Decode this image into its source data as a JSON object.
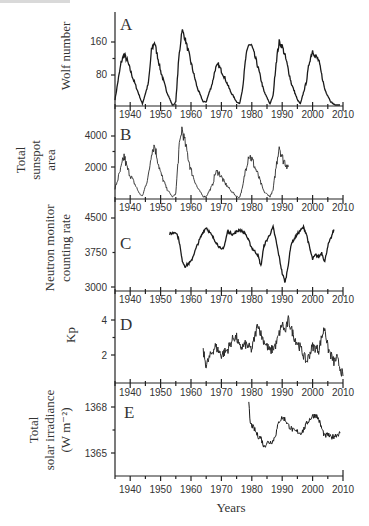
{
  "chart_data": [
    {
      "panel": "A",
      "type": "line",
      "ylabel": "Wolf number",
      "yticks": [
        80,
        160
      ],
      "ylim": [
        0,
        200
      ],
      "xlim": [
        1935,
        2010
      ],
      "x": [
        1935,
        1937,
        1938,
        1939,
        1941,
        1943,
        1944,
        1946,
        1947,
        1948,
        1950,
        1952,
        1954,
        1955,
        1956,
        1957,
        1958,
        1960,
        1962,
        1964,
        1965,
        1967,
        1968,
        1969,
        1971,
        1973,
        1975,
        1976,
        1977,
        1978,
        1979,
        1980,
        1982,
        1984,
        1986,
        1987,
        1988,
        1989,
        1990,
        1991,
        1993,
        1995,
        1996,
        1998,
        1999,
        2000,
        2001,
        2002,
        2004,
        2006,
        2008,
        2009
      ],
      "values": [
        20,
        110,
        130,
        115,
        70,
        30,
        10,
        60,
        140,
        160,
        90,
        40,
        5,
        15,
        120,
        190,
        170,
        110,
        50,
        15,
        15,
        60,
        95,
        105,
        75,
        40,
        15,
        10,
        50,
        120,
        155,
        150,
        100,
        40,
        10,
        30,
        110,
        160,
        150,
        125,
        60,
        20,
        10,
        65,
        115,
        140,
        125,
        115,
        45,
        15,
        3,
        5
      ]
    },
    {
      "panel": "B",
      "type": "line",
      "ylabel": "Total sunspot area",
      "yticks": [
        2000,
        4000
      ],
      "ylim": [
        0,
        4800
      ],
      "xlim": [
        1935,
        2010
      ],
      "x": [
        1935,
        1937,
        1938,
        1939,
        1941,
        1943,
        1944,
        1946,
        1947,
        1948,
        1950,
        1952,
        1954,
        1955,
        1956,
        1957,
        1958,
        1960,
        1962,
        1964,
        1965,
        1967,
        1968,
        1969,
        1971,
        1973,
        1975,
        1976,
        1977,
        1978,
        1979,
        1980,
        1982,
        1984,
        1986,
        1987,
        1988,
        1989,
        1990,
        1991,
        1992
      ],
      "values": [
        600,
        1900,
        2700,
        1900,
        1100,
        300,
        100,
        1400,
        3000,
        3400,
        1600,
        600,
        50,
        300,
        3000,
        4500,
        3600,
        1800,
        700,
        100,
        100,
        800,
        1600,
        1700,
        1000,
        500,
        100,
        50,
        700,
        1900,
        2800,
        2500,
        1500,
        400,
        100,
        500,
        2000,
        3400,
        2600,
        2300,
        2000
      ]
    },
    {
      "panel": "C",
      "type": "line",
      "ylabel": "Neutron monitor counting rate",
      "yticks": [
        3000,
        3750,
        4500
      ],
      "ylim": [
        2950,
        4600
      ],
      "xlim": [
        1935,
        2010
      ],
      "x": [
        1953,
        1955,
        1956,
        1957,
        1958,
        1959,
        1960,
        1962,
        1964,
        1965,
        1966,
        1968,
        1970,
        1971,
        1972,
        1974,
        1976,
        1978,
        1980,
        1982,
        1983,
        1984,
        1986,
        1987,
        1988,
        1989,
        1990,
        1991,
        1992,
        1993,
        1995,
        1997,
        1998,
        1999,
        2000,
        2001,
        2002,
        2003,
        2004,
        2005,
        2006,
        2007
      ],
      "values": [
        4150,
        4200,
        4050,
        3600,
        3450,
        3500,
        3550,
        3900,
        4200,
        4300,
        4200,
        4000,
        3800,
        3900,
        4200,
        4150,
        4250,
        4150,
        3850,
        3700,
        3450,
        3900,
        4150,
        4300,
        4000,
        3650,
        3300,
        3100,
        3500,
        3950,
        4150,
        4300,
        4150,
        3850,
        3600,
        3700,
        3650,
        3750,
        3550,
        3900,
        4050,
        4250
      ]
    },
    {
      "panel": "D",
      "type": "line",
      "ylabel": "Kp",
      "yticks": [
        2,
        4
      ],
      "ylim": [
        0.6,
        4.6
      ],
      "xlim": [
        1935,
        2010
      ],
      "x": [
        1964,
        1965,
        1966,
        1967,
        1968,
        1970,
        1972,
        1974,
        1975,
        1976,
        1978,
        1980,
        1982,
        1983,
        1984,
        1986,
        1988,
        1990,
        1991,
        1992,
        1994,
        1996,
        1998,
        2000,
        2002,
        2003,
        2004,
        2005,
        2006,
        2007,
        2008,
        2009,
        2010
      ],
      "values": [
        2.2,
        1.4,
        1.8,
        2.2,
        2.5,
        2.0,
        2.3,
        3.0,
        3.0,
        2.4,
        2.6,
        2.3,
        3.8,
        3.2,
        2.8,
        2.2,
        2.6,
        3.8,
        3.3,
        4.0,
        3.0,
        2.4,
        1.6,
        2.5,
        2.3,
        3.0,
        3.6,
        2.4,
        2.0,
        1.6,
        1.8,
        1.3,
        0.8
      ]
    },
    {
      "panel": "E",
      "type": "line",
      "ylabel": "Total solar irradiance (W m-2)",
      "yticks": [
        1365,
        1368
      ],
      "ylim": [
        1363.5,
        1368.5
      ],
      "xlim": [
        1935,
        2010
      ],
      "x": [
        1979,
        1979.5,
        1980,
        1981,
        1982,
        1983,
        1984,
        1985,
        1986,
        1987,
        1988,
        1989,
        1990,
        1991,
        1992,
        1993,
        1994,
        1995,
        1996,
        1997,
        1998,
        1999,
        2000,
        2001,
        2002,
        2003,
        2004,
        2005,
        2006,
        2007,
        2008,
        2009
      ],
      "values": [
        1368.2,
        1366.9,
        1366.8,
        1366.5,
        1366.1,
        1366.0,
        1365.4,
        1365.7,
        1365.7,
        1365.8,
        1366.3,
        1367.1,
        1367.3,
        1367.2,
        1366.8,
        1366.6,
        1366.4,
        1366.4,
        1366.3,
        1366.5,
        1366.9,
        1367.2,
        1367.4,
        1367.5,
        1367.2,
        1366.6,
        1366.1,
        1366.2,
        1366.0,
        1366.1,
        1366.2,
        1366.3
      ]
    }
  ],
  "panels": [
    {
      "letter": "A",
      "ylabel_lines": [
        "Wolf number"
      ],
      "yticks": [
        "80",
        "160"
      ]
    },
    {
      "letter": "B",
      "ylabel_lines": [
        "Total",
        "sunspot",
        "area"
      ],
      "yticks": [
        "2000",
        "4000"
      ]
    },
    {
      "letter": "C",
      "ylabel_lines": [
        "Neutron monitor",
        "counting rate"
      ],
      "yticks": [
        "3000",
        "3750",
        "4500"
      ]
    },
    {
      "letter": "D",
      "ylabel_lines": [
        "Kp"
      ],
      "yticks": [
        "2",
        "4"
      ]
    },
    {
      "letter": "E",
      "ylabel_lines": [
        "Total",
        "solar irradiance",
        "(W m⁻²)"
      ],
      "yticks": [
        "1365",
        "1368"
      ]
    }
  ],
  "xaxis": {
    "tick_labels": [
      "1940",
      "1950",
      "1960",
      "1970",
      "1980",
      "1990",
      "2000",
      "2010"
    ],
    "title": "Years"
  },
  "colors": {
    "line": "#1a1a1a",
    "axis": "#222222",
    "text": "#333333"
  }
}
